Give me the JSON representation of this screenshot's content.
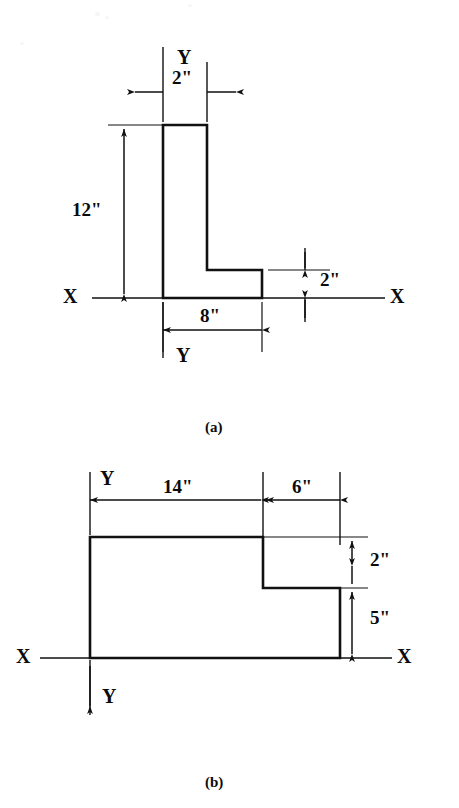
{
  "document": {
    "type": "engineering-cross-section-figure",
    "background_color": "#ffffff",
    "line_color": "#111111",
    "figures": [
      {
        "caption": "(a)",
        "shape": "L-shaped angle section",
        "axis_labels": {
          "x_left": "X",
          "x_right": "X",
          "y_top": "Y",
          "y_bottom": "Y"
        },
        "dimensions": [
          {
            "name": "stem-width",
            "value": "2\"",
            "orientation": "horizontal",
            "position": "top"
          },
          {
            "name": "overall-height",
            "value": "12\"",
            "orientation": "vertical",
            "position": "left"
          },
          {
            "name": "flange-thickness",
            "value": "2\"",
            "orientation": "vertical",
            "position": "right"
          },
          {
            "name": "overall-width",
            "value": "8\"",
            "orientation": "horizontal",
            "position": "bottom"
          }
        ]
      },
      {
        "caption": "(b)",
        "shape": "Stepped rectangular section",
        "axis_labels": {
          "x_left": "X",
          "x_right": "X",
          "y_top": "Y",
          "y_bottom": "Y"
        },
        "dimensions": [
          {
            "name": "left-segment-width",
            "value": "14\"",
            "orientation": "horizontal",
            "position": "top"
          },
          {
            "name": "right-segment-width",
            "value": "6\"",
            "orientation": "horizontal",
            "position": "top"
          },
          {
            "name": "step-height",
            "value": "2\"",
            "orientation": "vertical",
            "position": "right"
          },
          {
            "name": "lower-height",
            "value": "5\"",
            "orientation": "vertical",
            "position": "right"
          }
        ]
      }
    ]
  },
  "figure_a": {
    "caption": "(a)",
    "dim_stem_width": "2\"",
    "dim_height": "12\"",
    "dim_flange_thickness": "2\"",
    "dim_width": "8\"",
    "axis_x_left": "X",
    "axis_x_right": "X",
    "axis_y_top": "Y",
    "axis_y_bottom": "Y"
  },
  "figure_b": {
    "caption": "(b)",
    "dim_left_width": "14\"",
    "dim_right_width": "6\"",
    "dim_step_height": "2\"",
    "dim_lower_height": "5\"",
    "axis_x_left": "X",
    "axis_x_right": "X",
    "axis_y_top": "Y",
    "axis_y_bottom": "Y"
  }
}
